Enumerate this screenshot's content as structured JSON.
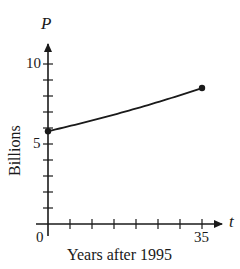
{
  "chart_data": {
    "type": "line",
    "title": "",
    "xlabel": "Years after 1995",
    "ylabel": "Billions",
    "x_axis_variable": "t",
    "y_axis_variable": "P",
    "x": [
      0,
      35
    ],
    "series": [
      {
        "name": "P",
        "values": [
          5.8,
          8.5
        ],
        "marker": "filled-circle-endpoints"
      }
    ],
    "xlim": [
      0,
      38
    ],
    "ylim": [
      0,
      11.2
    ],
    "x_ticks": [
      0,
      5,
      10,
      15,
      20,
      25,
      30,
      35
    ],
    "x_tick_labels": [
      "0",
      "35"
    ],
    "y_ticks": [
      1,
      2,
      3,
      4,
      5,
      6,
      7,
      8,
      9,
      10
    ],
    "y_tick_labels": [
      "5",
      "10"
    ],
    "grid": false,
    "legend": null,
    "colors": {
      "line": "#1a1a1a",
      "axis": "#1a1a1a"
    }
  },
  "labels": {
    "y_var": "P",
    "x_var": "t",
    "y_title": "Billions",
    "x_title": "Years after 1995",
    "origin": "0",
    "y_tick_5": "5",
    "y_tick_10": "10",
    "x_tick_35": "35"
  }
}
